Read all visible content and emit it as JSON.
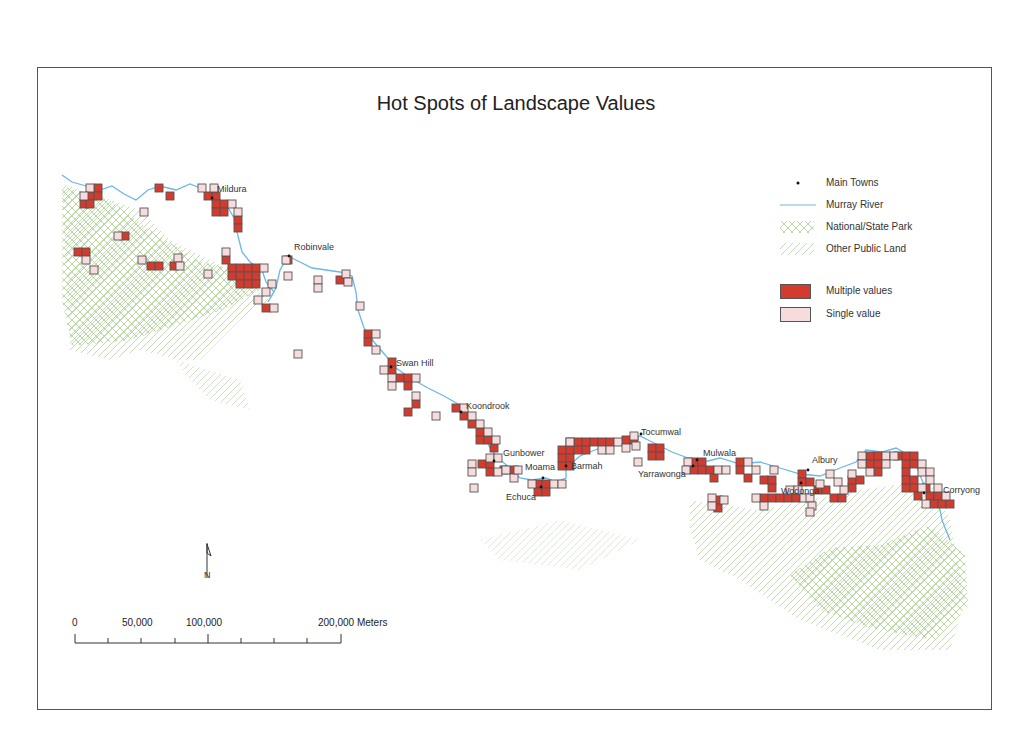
{
  "title": "Hot Spots of Landscape Values",
  "colors": {
    "multiple": "#d33b2f",
    "single": "#f6dcdc",
    "cell_border": "#555555",
    "river": "#6ab8e6",
    "park": "#a8d08d",
    "public_land": "#b5d4a0",
    "frame": "#555555"
  },
  "legend": {
    "items": [
      {
        "symbol": "dot",
        "label": "Main Towns"
      },
      {
        "symbol": "line",
        "label": "Murray River"
      },
      {
        "symbol": "crosshatch",
        "label": "National/State Park"
      },
      {
        "symbol": "hatch",
        "label": "Other Public Land"
      },
      {
        "symbol": "red-box",
        "label": "Multiple values"
      },
      {
        "symbol": "pink-box",
        "label": "Single value"
      }
    ]
  },
  "scale_bar": {
    "labels": [
      "0",
      "50,000",
      "100,000",
      "200,000 Meters"
    ],
    "unit": "Meters"
  },
  "north_arrow": {
    "label": "N"
  },
  "towns": [
    {
      "name": "Mildura",
      "x": 212,
      "y": 198,
      "lx": 217,
      "ly": 192
    },
    {
      "name": "Robinvale",
      "x": 289,
      "y": 256,
      "lx": 294,
      "ly": 250
    },
    {
      "name": "Swan Hill",
      "x": 391,
      "y": 367,
      "lx": 396,
      "ly": 366
    },
    {
      "name": "Koondrook",
      "x": 461,
      "y": 412,
      "lx": 466,
      "ly": 409
    },
    {
      "name": "Gunbower",
      "x": 494,
      "y": 461,
      "lx": 503,
      "ly": 456
    },
    {
      "name": "Moama",
      "x": 543,
      "y": 478,
      "lx": 525,
      "ly": 470
    },
    {
      "name": "Echuca",
      "x": 541,
      "y": 487,
      "lx": 506,
      "ly": 500
    },
    {
      "name": "Barmah",
      "x": 566,
      "y": 466,
      "lx": 571,
      "ly": 469
    },
    {
      "name": "Tocumwal",
      "x": 641,
      "y": 434,
      "lx": 641,
      "ly": 435
    },
    {
      "name": "Mulwala",
      "x": 697,
      "y": 460,
      "lx": 703,
      "ly": 456
    },
    {
      "name": "Yarrawonga",
      "x": 693,
      "y": 466,
      "lx": 638,
      "ly": 477
    },
    {
      "name": "Albury",
      "x": 808,
      "y": 470,
      "lx": 812,
      "ly": 463
    },
    {
      "name": "Wodonga",
      "x": 801,
      "y": 483,
      "lx": 781,
      "ly": 494
    },
    {
      "name": "Corryong",
      "x": 924,
      "y": 493,
      "lx": 943,
      "ly": 493
    }
  ],
  "cells": {
    "size": 8,
    "multiple": [
      [
        94,
        184
      ],
      [
        86,
        192
      ],
      [
        94,
        192
      ],
      [
        80,
        200
      ],
      [
        86,
        200
      ],
      [
        155,
        184
      ],
      [
        166,
        192
      ],
      [
        204,
        192
      ],
      [
        212,
        192
      ],
      [
        212,
        200
      ],
      [
        220,
        200
      ],
      [
        212,
        208
      ],
      [
        220,
        208
      ],
      [
        234,
        216
      ],
      [
        234,
        224
      ],
      [
        121,
        232
      ],
      [
        74,
        248
      ],
      [
        82,
        248
      ],
      [
        147,
        262
      ],
      [
        155,
        262
      ],
      [
        170,
        262
      ],
      [
        222,
        256
      ],
      [
        228,
        264
      ],
      [
        236,
        264
      ],
      [
        244,
        264
      ],
      [
        252,
        264
      ],
      [
        228,
        272
      ],
      [
        236,
        272
      ],
      [
        244,
        272
      ],
      [
        252,
        272
      ],
      [
        236,
        280
      ],
      [
        244,
        280
      ],
      [
        252,
        280
      ],
      [
        262,
        304
      ],
      [
        284,
        256
      ],
      [
        336,
        276
      ],
      [
        364,
        330
      ],
      [
        364,
        338
      ],
      [
        388,
        358
      ],
      [
        388,
        366
      ],
      [
        396,
        374
      ],
      [
        404,
        374
      ],
      [
        404,
        382
      ],
      [
        412,
        400
      ],
      [
        404,
        408
      ],
      [
        452,
        404
      ],
      [
        460,
        412
      ],
      [
        468,
        420
      ],
      [
        476,
        428
      ],
      [
        476,
        436
      ],
      [
        484,
        436
      ],
      [
        490,
        444
      ],
      [
        478,
        460
      ],
      [
        486,
        460
      ],
      [
        486,
        468
      ],
      [
        500,
        466
      ],
      [
        510,
        466
      ],
      [
        534,
        480
      ],
      [
        542,
        480
      ],
      [
        534,
        488
      ],
      [
        542,
        488
      ],
      [
        566,
        438
      ],
      [
        574,
        438
      ],
      [
        582,
        438
      ],
      [
        590,
        438
      ],
      [
        598,
        438
      ],
      [
        606,
        438
      ],
      [
        558,
        446
      ],
      [
        566,
        446
      ],
      [
        574,
        446
      ],
      [
        582,
        446
      ],
      [
        558,
        454
      ],
      [
        566,
        454
      ],
      [
        558,
        462
      ],
      [
        566,
        462
      ],
      [
        622,
        436
      ],
      [
        630,
        436
      ],
      [
        648,
        444
      ],
      [
        656,
        444
      ],
      [
        648,
        452
      ],
      [
        656,
        452
      ],
      [
        690,
        458
      ],
      [
        698,
        458
      ],
      [
        690,
        466
      ],
      [
        698,
        466
      ],
      [
        706,
        466
      ],
      [
        710,
        474
      ],
      [
        736,
        458
      ],
      [
        736,
        466
      ],
      [
        744,
        474
      ],
      [
        760,
        476
      ],
      [
        768,
        476
      ],
      [
        768,
        484
      ],
      [
        760,
        494
      ],
      [
        768,
        494
      ],
      [
        776,
        494
      ],
      [
        784,
        494
      ],
      [
        792,
        494
      ],
      [
        798,
        470
      ],
      [
        798,
        478
      ],
      [
        806,
        478
      ],
      [
        814,
        486
      ],
      [
        822,
        486
      ],
      [
        830,
        494
      ],
      [
        838,
        494
      ],
      [
        848,
        476
      ],
      [
        848,
        484
      ],
      [
        856,
        476
      ],
      [
        714,
        496
      ],
      [
        714,
        504
      ],
      [
        866,
        452
      ],
      [
        874,
        452
      ],
      [
        866,
        460
      ],
      [
        874,
        460
      ],
      [
        874,
        468
      ],
      [
        894,
        452
      ],
      [
        902,
        452
      ],
      [
        910,
        452
      ],
      [
        902,
        460
      ],
      [
        910,
        460
      ],
      [
        902,
        468
      ],
      [
        902,
        476
      ],
      [
        910,
        476
      ],
      [
        902,
        484
      ],
      [
        910,
        484
      ],
      [
        914,
        492
      ],
      [
        922,
        484
      ],
      [
        926,
        492
      ],
      [
        934,
        492
      ],
      [
        930,
        500
      ],
      [
        938,
        500
      ],
      [
        946,
        500
      ]
    ],
    "single": [
      [
        86,
        184
      ],
      [
        80,
        192
      ],
      [
        140,
        208
      ],
      [
        210,
        184
      ],
      [
        198,
        184
      ],
      [
        228,
        200
      ],
      [
        234,
        208
      ],
      [
        114,
        232
      ],
      [
        82,
        256
      ],
      [
        90,
        266
      ],
      [
        138,
        256
      ],
      [
        174,
        254
      ],
      [
        176,
        262
      ],
      [
        204,
        270
      ],
      [
        222,
        248
      ],
      [
        260,
        264
      ],
      [
        268,
        280
      ],
      [
        262,
        288
      ],
      [
        254,
        296
      ],
      [
        270,
        304
      ],
      [
        282,
        256
      ],
      [
        284,
        272
      ],
      [
        314,
        276
      ],
      [
        314,
        284
      ],
      [
        342,
        270
      ],
      [
        344,
        278
      ],
      [
        356,
        302
      ],
      [
        294,
        350
      ],
      [
        372,
        330
      ],
      [
        372,
        346
      ],
      [
        380,
        366
      ],
      [
        388,
        374
      ],
      [
        388,
        382
      ],
      [
        412,
        374
      ],
      [
        412,
        392
      ],
      [
        432,
        412
      ],
      [
        460,
        404
      ],
      [
        468,
        412
      ],
      [
        476,
        420
      ],
      [
        484,
        428
      ],
      [
        492,
        436
      ],
      [
        468,
        460
      ],
      [
        468,
        468
      ],
      [
        470,
        484
      ],
      [
        486,
        454
      ],
      [
        494,
        454
      ],
      [
        494,
        468
      ],
      [
        502,
        466
      ],
      [
        510,
        474
      ],
      [
        550,
        480
      ],
      [
        558,
        480
      ],
      [
        528,
        480
      ],
      [
        514,
        466
      ],
      [
        566,
        438
      ],
      [
        598,
        446
      ],
      [
        606,
        446
      ],
      [
        614,
        438
      ],
      [
        630,
        432
      ],
      [
        632,
        442
      ],
      [
        622,
        444
      ],
      [
        634,
        458
      ],
      [
        684,
        458
      ],
      [
        682,
        466
      ],
      [
        714,
        466
      ],
      [
        722,
        466
      ],
      [
        744,
        458
      ],
      [
        752,
        466
      ],
      [
        770,
        466
      ],
      [
        786,
        486
      ],
      [
        794,
        486
      ],
      [
        800,
        494
      ],
      [
        816,
        480
      ],
      [
        826,
        470
      ],
      [
        834,
        478
      ],
      [
        840,
        486
      ],
      [
        848,
        470
      ],
      [
        708,
        494
      ],
      [
        708,
        502
      ],
      [
        720,
        496
      ],
      [
        752,
        494
      ],
      [
        760,
        502
      ],
      [
        806,
        494
      ],
      [
        808,
        502
      ],
      [
        806,
        508
      ],
      [
        858,
        452
      ],
      [
        858,
        460
      ],
      [
        866,
        468
      ],
      [
        882,
        452
      ],
      [
        882,
        460
      ],
      [
        890,
        452
      ],
      [
        918,
        460
      ],
      [
        918,
        468
      ],
      [
        926,
        468
      ],
      [
        926,
        476
      ],
      [
        918,
        484
      ],
      [
        934,
        484
      ],
      [
        922,
        500
      ],
      [
        942,
        492
      ]
    ]
  }
}
